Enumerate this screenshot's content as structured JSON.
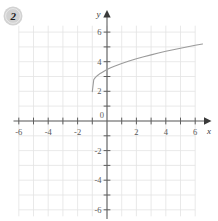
{
  "badge": {
    "label": "2",
    "shape": "circle",
    "fill_color": "#d2d2d2",
    "text_color": "#1c1c1c"
  },
  "colors": {
    "grid": "#e3e3e3",
    "axis": "#5f5f5f",
    "curve": "#9b9b9b",
    "tick_text": "#5a5a5a",
    "background": "#ffffff"
  },
  "axes": {
    "x_label": "x",
    "y_label": "y",
    "origin_label": "0",
    "x_tick_labels": [
      "-6",
      "-4",
      "-2",
      "2",
      "4",
      "6"
    ],
    "y_tick_labels": [
      "6",
      "4",
      "2",
      "-2",
      "-4",
      "-6"
    ],
    "x_arrow": true,
    "y_arrow": true
  },
  "chart_data": {
    "type": "line",
    "title": "",
    "xlabel": "x",
    "ylabel": "y",
    "xlim": [
      -6.5,
      6.5
    ],
    "ylim": [
      -6.5,
      6.5
    ],
    "xticks": [
      -6,
      -5,
      -4,
      -3,
      -2,
      -1,
      1,
      2,
      3,
      4,
      5,
      6
    ],
    "yticks": [
      -6,
      -5,
      -4,
      -3,
      -2,
      -1,
      1,
      2,
      3,
      4,
      5,
      6
    ],
    "xtick_labels_shown": [
      -6,
      -4,
      -2,
      2,
      4,
      6
    ],
    "ytick_labels_shown": [
      6,
      4,
      2,
      -2,
      -4,
      -6
    ],
    "grid": true,
    "legend": null,
    "series": [
      {
        "name": "sqrt-curve",
        "color": "#9b9b9b",
        "equation_form": "y = sqrt(x + 1) + 2.5",
        "x": [
          -1.0,
          -0.9,
          -0.8,
          -0.7,
          -0.6,
          -0.5,
          -0.4,
          -0.2,
          0.0,
          0.25,
          0.5,
          1.0,
          1.5,
          2.0,
          2.5,
          3.0,
          3.5,
          4.0,
          4.5,
          5.0,
          5.5,
          6.0,
          6.5
        ],
        "y": [
          2.0,
          2.82,
          2.95,
          3.05,
          3.13,
          3.21,
          3.27,
          3.39,
          3.5,
          3.62,
          3.72,
          3.91,
          4.08,
          4.23,
          4.37,
          4.5,
          4.62,
          4.74,
          4.85,
          4.95,
          5.05,
          5.15,
          5.24
        ]
      }
    ]
  }
}
